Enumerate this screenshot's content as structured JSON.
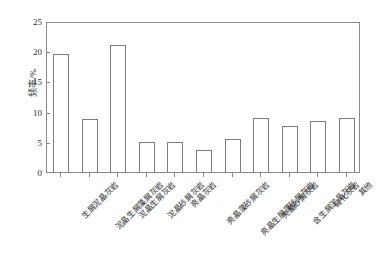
{
  "chart_data": {
    "type": "bar",
    "title": "",
    "xlabel": "",
    "ylabel": "频率/%",
    "ylim": [
      0,
      25
    ],
    "yticks": [
      0,
      5,
      10,
      15,
      20,
      25
    ],
    "ytick_labels": [
      "0",
      "5",
      "10",
      "15",
      "20",
      "25"
    ],
    "grid": false,
    "legend": "none",
    "categories": [
      "生屑泥晶灰岩",
      "泥晶生屑藻屑灰岩",
      "泥晶生屑灰岩",
      "泥晶砂屑灰岩",
      "亮晶灰岩",
      "亮晶藻砂屑灰岩",
      "亮晶生屑藻砂屑灰岩",
      "亮晶砂屑灰岩",
      "含生屑泥晶灰岩",
      "硅化灰岩",
      "其他"
    ],
    "values": [
      19.5,
      8.8,
      21.0,
      4.9,
      4.9,
      3.6,
      5.5,
      9.0,
      7.7,
      8.4,
      9.0
    ],
    "bar_fill": "#ffffff",
    "bar_stroke": "#7d7d7d",
    "axis_color": "#8a8a8a",
    "text_color": "#2b2b2b"
  }
}
